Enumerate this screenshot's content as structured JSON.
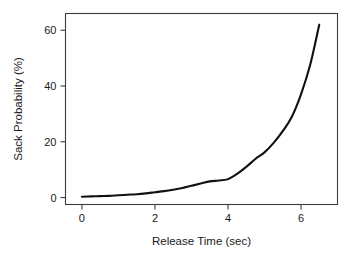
{
  "chart_data": {
    "type": "line",
    "title": "",
    "subtitle": "",
    "xlabel": "Release Time (sec)",
    "ylabel": "Sack Probability (%)",
    "xlim": [
      -0.45,
      7.0
    ],
    "ylim": [
      -2.5,
      66.0
    ],
    "grid": false,
    "legend": null,
    "xticks": [
      0,
      2,
      4,
      6
    ],
    "xtick_labels": [
      "0",
      "2",
      "4",
      "6"
    ],
    "yticks": [
      0,
      20,
      40,
      60
    ],
    "ytick_labels": [
      "0",
      "20",
      "40",
      "60"
    ],
    "line_color": "#111111",
    "series": [
      {
        "name": "Sack Probability",
        "x": [
          0.0,
          0.25,
          0.5,
          0.75,
          1.0,
          1.25,
          1.5,
          1.75,
          2.0,
          2.25,
          2.5,
          2.75,
          3.0,
          3.25,
          3.5,
          3.75,
          4.0,
          4.25,
          4.5,
          4.75,
          5.0,
          5.25,
          5.5,
          5.75,
          6.0,
          6.25,
          6.5
        ],
        "y": [
          0.3,
          0.4,
          0.5,
          0.6,
          0.8,
          1.0,
          1.2,
          1.5,
          1.9,
          2.3,
          2.8,
          3.4,
          4.2,
          5.0,
          5.8,
          6.1,
          6.6,
          8.5,
          11.0,
          13.8,
          16.2,
          19.6,
          23.8,
          29.0,
          37.0,
          47.5,
          62.0
        ]
      }
    ],
    "annotations": []
  },
  "axes": {
    "x_title": "Release Time (sec)",
    "y_title": "Sack Probability (%)"
  }
}
